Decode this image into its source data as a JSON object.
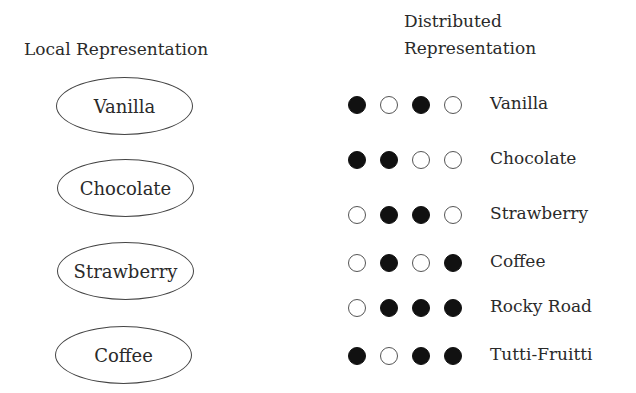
{
  "local": {
    "heading": "Local Representation",
    "items": [
      "Vanilla",
      "Chocolate",
      "Strawberry",
      "Coffee"
    ]
  },
  "distributed": {
    "heading_line1": "Distributed",
    "heading_line2": "Representation",
    "rows": [
      {
        "label": "Vanilla",
        "pattern": [
          1,
          0,
          1,
          0
        ]
      },
      {
        "label": "Chocolate",
        "pattern": [
          1,
          1,
          0,
          0
        ]
      },
      {
        "label": "Strawberry",
        "pattern": [
          0,
          1,
          1,
          0
        ]
      },
      {
        "label": "Coffee",
        "pattern": [
          0,
          1,
          0,
          1
        ]
      },
      {
        "label": "Rocky Road",
        "pattern": [
          0,
          1,
          1,
          1
        ]
      },
      {
        "label": "Tutti-Fruitti",
        "pattern": [
          1,
          0,
          1,
          1
        ]
      }
    ]
  },
  "colors": {
    "filled": "#111111",
    "outline": "#555555",
    "text": "#2a2a2a"
  }
}
